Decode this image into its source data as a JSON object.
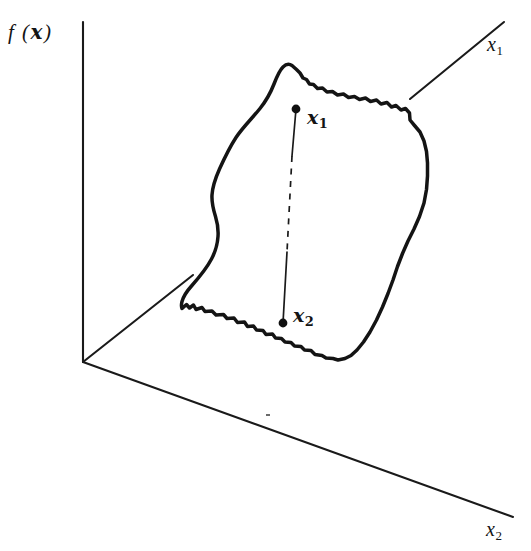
{
  "figure": {
    "caption_alt": "Convex region in the x1-x2 plane with two points joined by a line segment",
    "background_color": "#ffffff",
    "ink_color": "#141414"
  },
  "axes": {
    "vertical": {
      "label_text": "f (  )",
      "label_prefix": "f (",
      "label_vector": "x",
      "label_suffix": ")",
      "origin_x": 83,
      "origin_y": 362,
      "top_y": 22
    },
    "depth": {
      "label_x": "x",
      "label_sub": "1",
      "end_x": 504,
      "end_y": 22
    },
    "horizontal": {
      "label_x": "x",
      "label_sub": "2",
      "end_x": 513,
      "end_y": 517
    }
  },
  "points": [
    {
      "id": "point-x1",
      "label_x": "x",
      "label_sub": "1",
      "cx": 296,
      "cy": 109,
      "r": 4.4
    },
    {
      "id": "point-x2",
      "label_x": "x",
      "label_sub": "2",
      "cx": 283,
      "cy": 323,
      "r": 4.4
    }
  ],
  "chord": {
    "solid_upper": "M296,109 L292,156",
    "dashed_middle": "M292,156 L287,252",
    "solid_lower": "M287,252 L283,323"
  },
  "region": {
    "name": "convex-set-outline",
    "path": "M292.0,65.5 C289.0,63.5 285.5,64.5 283.0,67.0 C279.0,71.0 276.5,77.5 274.0,84.0 C270.5,93.0 266.0,101.0 260.0,108.5 C252.0,118.5 243.0,127.0 236.0,137.5 C229.5,147.5 224.5,158.0 219.5,169.0 C215.5,178.0 212.5,186.5 212.0,195.0 C211.5,203.5 213.5,210.0 215.5,216.5 C217.5,223.0 218.5,229.5 218.0,236.5 C217.5,244.0 215.5,251.5 211.5,259.0 C206.5,268.5 199.0,277.5 191.5,286.0 C187.0,291.0 183.5,296.0 182.0,301.5 C181.2,304.5 181.4,307.0 182.0,308.5 L186.5,304.5 L189.5,308.0 L193.5,305.0 L196.0,309.5 L202.0,307.5 L205.0,311.5 L212.0,311.0 L216.0,315.0 L223.5,314.5 L227.0,318.5 L234.0,318.0 L237.5,322.5 L244.5,322.0 L247.5,326.5 L253.5,326.0 L256.5,330.0 L263.0,330.5 L266.0,334.5 L272.5,334.0 L275.5,338.0 L281.5,338.5 L285.0,342.0 L291.0,342.5 L294.5,346.0 L301.0,346.5 L304.5,350.0 L311.0,350.5 L315.0,354.5 L322.0,355.5 L326.0,358.0 L333.0,358.5 L338.0,360.0 L345.0,358.5 L351.0,355.5 L357.0,350.0 L363.5,342.0 L370.0,332.0 L376.5,320.0 L382.5,307.0 L388.0,293.5 L393.0,280.0 L397.5,266.5 L402.5,253.5 L408.0,241.0 L414.0,229.0 L419.5,216.5 L424.0,203.0 L426.5,189.5 L427.5,176.0 L427.5,163.0 L426.5,151.5 L424.0,141.0 L420.0,132.0 L414.5,125.5 L410.0,120.0 L409.5,113.0 L405.5,108.5 L401.0,110.0 L396.0,105.5 L391.5,107.0 L387.0,102.5 L381.0,104.0 L376.5,100.0 L370.5,101.5 L365.5,98.0 L359.5,99.5 L354.5,96.5 L348.5,97.5 L343.5,94.0 L337.5,95.0 L332.5,91.5 L327.0,92.0 L322.5,88.0 L317.5,88.5 L313.5,84.5 L309.5,84.0 L306.5,79.5 L303.0,78.0 L300.0,73.0 L296.5,69.5 Z"
  },
  "depth_axis_segments": {
    "behind_region_left": "M83,362 L193,275",
    "outside_region_right": "M410,99 L504,22"
  },
  "horizontal_axis_segment": "M83,362 L513,517",
  "tick_speck": {
    "cx": 268,
    "cy": 415,
    "w": 4,
    "h": 2
  }
}
